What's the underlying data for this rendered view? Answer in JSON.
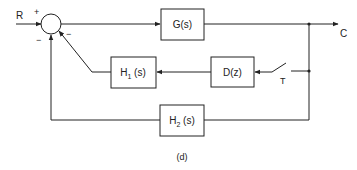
{
  "diagram": {
    "input_label": "R",
    "output_label": "C",
    "summing_signs": {
      "plus": "+",
      "minus_left": "−",
      "minus_right": "−"
    },
    "blocks": {
      "forward": "G(s)",
      "h1_main": "H",
      "h1_sub": "1",
      "h1_arg": " (s)",
      "d": "D(z)",
      "h2_main": "H",
      "h2_sub": "2",
      "h2_arg": " (s)"
    },
    "sampler_label": "T",
    "caption": "(d)"
  },
  "colors": {
    "line": "#222222",
    "background": "#ffffff"
  }
}
